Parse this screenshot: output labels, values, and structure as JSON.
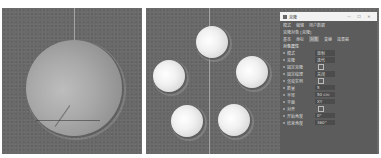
{
  "left_viewport": {
    "description": "single sphere object in perspective viewport",
    "objects": [
      "sphere"
    ]
  },
  "right_viewport": {
    "description": "cloner with spheres in radial arrangement",
    "clone_count": 5
  },
  "attributes_panel": {
    "title": "克隆",
    "window_buttons": {
      "minimize": "—",
      "maximize": "☐",
      "close": "✕"
    },
    "menu": [
      "模式",
      "编辑",
      "用户数据"
    ],
    "object_line": "克隆对象 [克隆]",
    "tabs": [
      {
        "label": "基本",
        "active": false
      },
      {
        "label": "坐标",
        "active": false
      },
      {
        "label": "对象",
        "active": true
      },
      {
        "label": "变换",
        "active": false
      },
      {
        "label": "效果器",
        "active": false
      }
    ],
    "section_title": "对象属性",
    "rows": [
      {
        "label": "模式",
        "value": "放射"
      },
      {
        "label": "克隆",
        "value": "迭代"
      },
      {
        "label": "固定克隆",
        "value": ""
      },
      {
        "label": "固定纹理",
        "value": "关闭"
      },
      {
        "label": "渲染实例",
        "value": ""
      },
      {
        "label": "数量",
        "value": "5"
      },
      {
        "label": "半径",
        "value": "50 cm"
      },
      {
        "label": "平面",
        "value": "XY"
      },
      {
        "label": "对齐",
        "value": ""
      },
      {
        "label": "开始角度",
        "value": "0°"
      },
      {
        "label": "结束角度",
        "value": "360°"
      }
    ]
  }
}
